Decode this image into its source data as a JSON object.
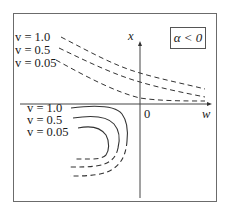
{
  "figure": {
    "condition_label": "α < 0",
    "axes": {
      "vertical_label": "x",
      "horizontal_label": "w",
      "origin_label": "0"
    },
    "upper_legend": [
      {
        "label": "v = 1.0"
      },
      {
        "label": "v = 0.5"
      },
      {
        "label": "v = 0.05"
      }
    ],
    "lower_legend": [
      {
        "label": "v = 1.0"
      },
      {
        "label": "v = 0.5"
      },
      {
        "label": "v = 0.05"
      }
    ],
    "colors": {
      "frame": "#6b6b6b",
      "curves": "#333333",
      "axes": "#444444",
      "background": "#ffffff"
    }
  }
}
